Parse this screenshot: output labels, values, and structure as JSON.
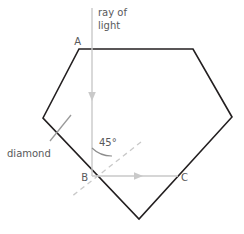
{
  "figure": {
    "title_alt": "diamond pentagon with ray of light at 45 degrees",
    "colors": {
      "prism_outline": "#231f20",
      "ray": "#c9c9c9",
      "normal_dashed": "#c9c9c9",
      "leader_line": "#9a9a9a",
      "angle_arc": "#8c8c8c",
      "text": "#58595b",
      "background": "#ffffff"
    },
    "labels": {
      "ray_line_1": "ray of",
      "ray_line_2": "light",
      "material": "diamond",
      "angle": "45°",
      "vertex_a": "A",
      "vertex_b": "B",
      "vertex_c": "C"
    },
    "geometry": {
      "prism_vertices": "79,49 193,49 232,117 139,219 43,118",
      "incident_ray": {
        "x1": 92,
        "y1": 8,
        "x2": 92,
        "y2": 176
      },
      "refracted_ray": {
        "x1": 92,
        "y1": 176,
        "x2": 178,
        "y2": 176
      },
      "normal_dashed": {
        "x1": 141,
        "y1": 142,
        "x2": 71,
        "y2": 197
      },
      "leader_line": {
        "x1": 71,
        "y1": 115,
        "x2": 50,
        "y2": 141
      },
      "angle_arc_path": "M 92 146 A 30 30 0 0 0 113 154"
    }
  }
}
